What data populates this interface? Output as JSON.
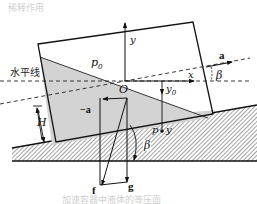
{
  "figure": {
    "title_caption": "稀释作用",
    "bottom_caption": "加速容器中液体的等压面",
    "labels": {
      "horizontal_line": "水平线",
      "origin": "O",
      "x_axis": "x",
      "y_axis": "y",
      "p0": "p",
      "p0_sub": "0",
      "y0": "y",
      "y0_sub": "0",
      "point_p": "p",
      "point_y": "y",
      "height": "H",
      "accel": "a",
      "neg_accel": "−a",
      "force_f": "f",
      "gravity_g": "g",
      "beta_top": "β",
      "beta_bottom": "β"
    },
    "colors": {
      "liquid_fill": "#d3d3d3",
      "line": "#111111",
      "hatch": "#555555"
    }
  }
}
